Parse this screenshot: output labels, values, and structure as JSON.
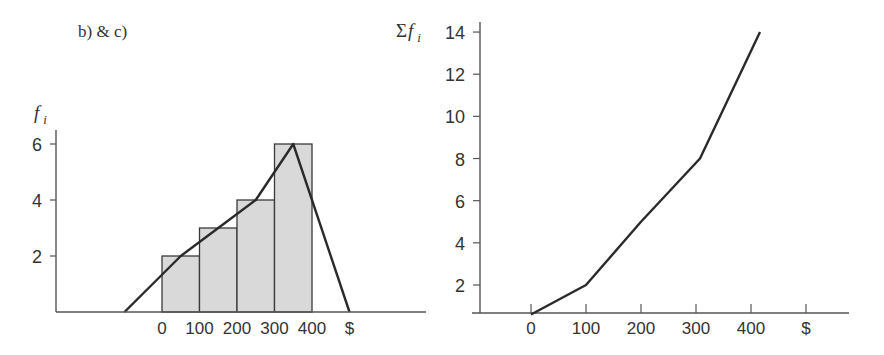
{
  "header": {
    "label": "b)  & c)"
  },
  "colors": {
    "ink": "#2a2a2a",
    "axis": "#555555",
    "bar_fill": "#d9d9d9",
    "bar_stroke": "#3a3a3a",
    "background": "#ffffff"
  },
  "chart_data": [
    {
      "type": "bar",
      "subtype": "histogram_with_frequency_polygon",
      "title": "",
      "ylabel": "f_i",
      "xlabel": "$",
      "x_tick_labels": [
        "0",
        "100",
        "200",
        "300",
        "400",
        "$"
      ],
      "y_tick_labels": [
        "2",
        "4",
        "6"
      ],
      "ylim": [
        0,
        6.5
      ],
      "grid": false,
      "bins": [
        {
          "from": 0,
          "to": 100,
          "frequency": 2
        },
        {
          "from": 100,
          "to": 200,
          "frequency": 3
        },
        {
          "from": 200,
          "to": 300,
          "frequency": 4
        },
        {
          "from": 300,
          "to": 400,
          "frequency": 6
        }
      ],
      "categories": [
        "0-100",
        "100-200",
        "200-300",
        "300-400"
      ],
      "values": [
        2,
        3,
        4,
        6
      ],
      "frequency_polygon": {
        "x": [
          -100,
          50,
          150,
          250,
          350,
          500
        ],
        "y": [
          0,
          2,
          3,
          4,
          6,
          0
        ]
      }
    },
    {
      "type": "line",
      "subtype": "cumulative_frequency_ogive",
      "title": "",
      "ylabel": "Σf_i",
      "xlabel": "$",
      "x_tick_labels": [
        "0",
        "100",
        "200",
        "300",
        "400",
        "$"
      ],
      "y_tick_labels": [
        "2",
        "4",
        "6",
        "8",
        "10",
        "12",
        "14"
      ],
      "ylim": [
        0.7,
        14.8
      ],
      "grid": false,
      "x": [
        0,
        100,
        200,
        300,
        400
      ],
      "y": [
        0.6,
        2,
        5,
        8,
        14
      ],
      "series": [
        {
          "name": "cumulative frequency",
          "x": [
            0,
            100,
            200,
            300,
            400
          ],
          "values": [
            0.6,
            2,
            5,
            8,
            14
          ]
        }
      ]
    }
  ]
}
